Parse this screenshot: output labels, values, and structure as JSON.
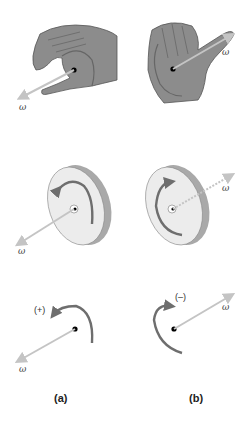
{
  "figure": {
    "colors": {
      "hand": "#8c8c8c",
      "hand_outline": "#555555",
      "disk_face": "#ececec",
      "disk_rim": "#a9a9a9",
      "rotation_arrow": "#6e6e6e",
      "omega_vector": "#c4c4c4",
      "axis_dot": "#000000"
    },
    "rows": [
      {
        "name": "hands",
        "left_omega": "ω",
        "right_omega": "ω"
      },
      {
        "name": "disks",
        "left_omega": "ω",
        "right_omega": "ω"
      },
      {
        "name": "schematic",
        "left_omega": "ω",
        "right_omega": "ω",
        "left_sign": "(+)",
        "right_sign": "(–)"
      }
    ],
    "panels": [
      {
        "label": "(a)"
      },
      {
        "label": "(b)"
      }
    ]
  }
}
